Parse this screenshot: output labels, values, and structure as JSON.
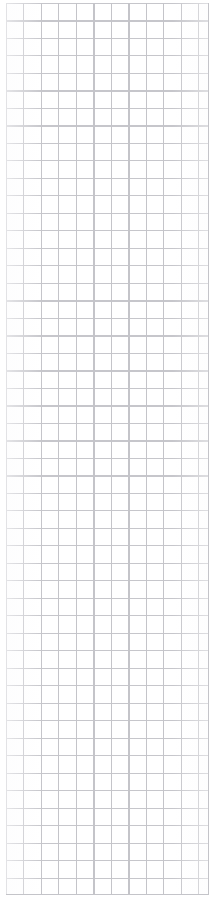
{
  "page": {
    "name": "grid-sheet",
    "content_type": "blank-ruled-grid",
    "background_color": "#ffffff",
    "width_px": 215,
    "height_px": 907,
    "text_content": "",
    "notes_visible": ""
  },
  "grid": {
    "columns": 11,
    "rows": 51,
    "cell_size_px": 17.5,
    "line_color": "#c4c4c9",
    "line_color_horizontal": "#c6c6cb",
    "line_width_px": 1,
    "origin_x_px": 6,
    "origin_y_px": 3,
    "grid_width_px": 203,
    "grid_height_px": 892,
    "margin_left_px": 6,
    "margin_right_px": 6,
    "margin_top_px": 3,
    "margin_bottom_px": 12
  }
}
